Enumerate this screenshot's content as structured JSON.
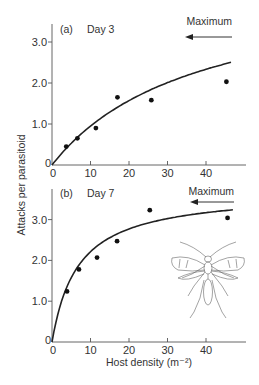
{
  "chart_data": [
    {
      "type": "scatter",
      "panel": "(a)",
      "title": "Day 3",
      "xlabel": "",
      "ylabel": "Attacks per parasitoid",
      "xlim": [
        0,
        48
      ],
      "ylim": [
        0,
        3.4
      ],
      "xticks": [
        0,
        10,
        20,
        30,
        40
      ],
      "yticks": [
        0,
        1.0,
        2.0,
        3.0
      ],
      "ytick_labels": [
        "0",
        "1.0",
        "2.0",
        "3.0"
      ],
      "grid": false,
      "annotation": "Maximum",
      "annotation_arrow": "left",
      "series": [
        {
          "name": "Observed",
          "kind": "points",
          "x": [
            3.7,
            6.6,
            11.4,
            17.0,
            25.8,
            45.3
          ],
          "y": [
            0.45,
            0.65,
            0.9,
            1.65,
            1.58,
            2.03
          ]
        },
        {
          "name": "Fitted type II response",
          "kind": "line",
          "a": 0.12,
          "Th": 0.22,
          "x_max": 46.5
        }
      ]
    },
    {
      "type": "scatter",
      "panel": "(b)",
      "title": "Day 7",
      "xlabel": "Host density (m⁻²)",
      "ylabel": "Attacks per parasitoid",
      "xlim": [
        0,
        48
      ],
      "ylim": [
        0,
        3.6
      ],
      "xticks": [
        0,
        10,
        20,
        30,
        40
      ],
      "yticks": [
        0,
        1.0,
        2.0,
        3.0
      ],
      "ytick_labels": [
        "0",
        "1.0",
        "2.0",
        "3.0"
      ],
      "grid": false,
      "annotation": "Maximum",
      "annotation_arrow": "left",
      "series": [
        {
          "name": "Observed",
          "kind": "points",
          "x": [
            3.9,
            7.0,
            11.7,
            16.9,
            25.4,
            45.6
          ],
          "y": [
            1.24,
            1.78,
            2.07,
            2.47,
            3.23,
            3.04
          ]
        },
        {
          "name": "Fitted type II response",
          "kind": "line",
          "a": 0.55,
          "Th": 0.27,
          "x_max": 47
        }
      ]
    }
  ],
  "figure": {
    "ylabel": "Attacks per parasitoid",
    "xlabel": "Host density (m⁻²)",
    "panels": [
      {
        "panel_label": "(a)",
        "title": "Day 3",
        "annotation": "Maximum"
      },
      {
        "panel_label": "(b)",
        "title": "Day 7",
        "annotation": "Maximum"
      }
    ],
    "illustration": "parasitoid-wasp"
  }
}
